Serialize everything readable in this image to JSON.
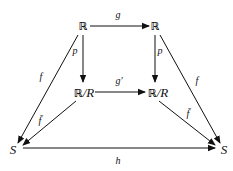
{
  "nodes": {
    "top_left": {
      "bb": "ℝ",
      "rest": ""
    },
    "top_right": {
      "bb": "ℝ",
      "rest": ""
    },
    "mid_left": {
      "bb": "ℝ",
      "rest": "/R"
    },
    "mid_right": {
      "bb": "ℝ",
      "rest": "/R"
    },
    "bottom_left": {
      "bb": "",
      "rest": "S"
    },
    "bottom_right": {
      "bb": "",
      "rest": "S"
    }
  },
  "arrows": {
    "g": "g",
    "p_left": "p",
    "p_right": "p",
    "g_prime": "g′",
    "f_left": "f",
    "f_right": "f",
    "fbar_left": "f̄",
    "fbar_right": "f̄",
    "h": "h"
  },
  "colors": {
    "stroke": "#111111",
    "background": "#ffffff"
  }
}
